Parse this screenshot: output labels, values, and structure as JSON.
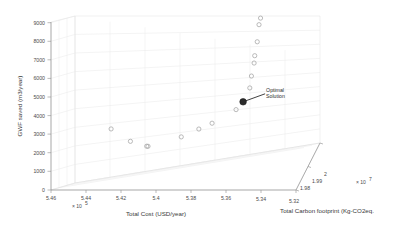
{
  "chart_data": {
    "type": "scatter",
    "title": "",
    "projection": "3d",
    "xlabel": "Total Cost (USD/year)",
    "ylabel": "GWF saved (m3/year)",
    "zlabel": "Total Carbon footprint (Kg-CO2eq.",
    "x_ticks": [
      "5.46",
      "5.44",
      "5.42",
      "5.4",
      "5.38",
      "5.36",
      "5.34",
      "5.32"
    ],
    "x_exponent": "× 10",
    "x_exponent_power": "5",
    "y_ticks": [
      "0",
      "1000",
      "2000",
      "3000",
      "4000",
      "5000",
      "6000",
      "7000",
      "8000",
      "9000"
    ],
    "z_ticks": [
      "1.98",
      "1.99",
      "2"
    ],
    "z_exponent": "× 10",
    "z_exponent_power": "7",
    "xlim": [
      5.32,
      5.46
    ],
    "ylim": [
      0,
      9000
    ],
    "zlim": [
      1.98,
      2.0
    ],
    "grid": true,
    "legend": "none",
    "marker_style": "open-circle",
    "marker_color": "#a8a8a8",
    "optimal_marker_color": "#2b2b2b",
    "annotations": [
      {
        "label_line1": "Optimal",
        "label_line2": "Solution",
        "x": 5.426,
        "y": 4050,
        "z": 1.9855
      }
    ],
    "points": [
      {
        "x": 5.4385,
        "y": 9020,
        "z": 1.9818
      },
      {
        "x": 5.4375,
        "y": 8640,
        "z": 1.982
      },
      {
        "x": 5.4362,
        "y": 7670,
        "z": 1.9824
      },
      {
        "x": 5.4345,
        "y": 6870,
        "z": 1.9828
      },
      {
        "x": 5.434,
        "y": 6450,
        "z": 1.983
      },
      {
        "x": 5.4322,
        "y": 5700,
        "z": 1.9834
      },
      {
        "x": 5.431,
        "y": 5010,
        "z": 1.9838
      },
      {
        "x": 5.4262,
        "y": 4050,
        "z": 1.9855
      },
      {
        "x": 5.4215,
        "y": 3540,
        "z": 1.9862
      },
      {
        "x": 5.406,
        "y": 2480,
        "z": 1.9888
      },
      {
        "x": 5.3975,
        "y": 1990,
        "z": 1.9902
      },
      {
        "x": 5.3862,
        "y": 1340,
        "z": 1.992
      },
      {
        "x": 5.365,
        "y": 430,
        "z": 1.9952
      },
      {
        "x": 5.3642,
        "y": 420,
        "z": 1.9953
      },
      {
        "x": 5.354,
        "y": 520,
        "z": 1.9966
      },
      {
        "x": 5.342,
        "y": 1010,
        "z": 1.998
      }
    ]
  },
  "colors": {
    "background": "#ffffff",
    "grid": "#e3e3e3",
    "axis": "#9a9a9a",
    "marker": "#a8a8a8",
    "optimal": "#2b2b2b",
    "text": "#3a3a3a"
  }
}
